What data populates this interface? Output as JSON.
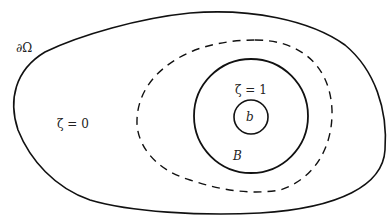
{
  "labels": {
    "boundary": "∂Ω",
    "outer_region": "ζ = 0",
    "inner_region": "ζ = 1",
    "small_ball": "b",
    "ball": "B"
  },
  "colors": {
    "stroke": "#111111",
    "background": "#ffffff"
  }
}
